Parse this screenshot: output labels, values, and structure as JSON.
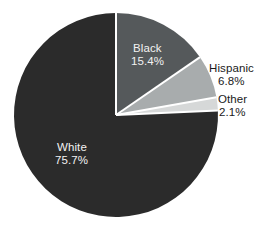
{
  "chart_data": {
    "type": "pie",
    "title": "",
    "subtitle": "",
    "xlabel": "",
    "ylabel": "",
    "legend_position": "none",
    "grid": false,
    "start_angle_deg": 0,
    "direction": "clockwise",
    "categories": [
      "Black",
      "Hispanic",
      "Other",
      "White"
    ],
    "values": [
      15.4,
      6.8,
      2.1,
      75.7
    ],
    "units": "percent",
    "slices": [
      {
        "label": "Black",
        "value": 15.4,
        "value_label": "15.4%",
        "color": "#55595b",
        "label_placement": "inside",
        "label_color": "#f2f2f2"
      },
      {
        "label": "Hispanic",
        "value": 6.8,
        "value_label": "6.8%",
        "color": "#a8acad",
        "label_placement": "outside",
        "label_color": "#1a1a1a"
      },
      {
        "label": "Other",
        "value": 2.1,
        "value_label": "2.1%",
        "color": "#d6d8d8",
        "label_placement": "outside",
        "label_color": "#1a1a1a"
      },
      {
        "label": "White",
        "value": 75.7,
        "value_label": "75.7%",
        "color": "#2b2b2b",
        "label_placement": "inside",
        "label_color": "#f2f2f2"
      }
    ],
    "separator_color": "#ffffff",
    "background_color": "#ffffff"
  },
  "geometry": {
    "center_x": 116,
    "center_y": 115,
    "radius": 102
  }
}
